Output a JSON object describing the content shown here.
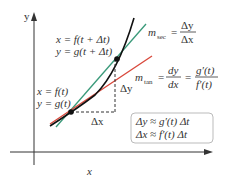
{
  "axes": {
    "x_label": "x",
    "y_label": "y"
  },
  "labels": {
    "point2_line1": "x = f(t + Δt)",
    "point2_line2": "y = g(t + Δt)",
    "point1_line1": "x = f(t)",
    "point1_line2": "y = g(t)",
    "m_sec": "m",
    "m_sec_sub": "sec",
    "m_sec_num": "Δy",
    "m_sec_den": "Δx",
    "m_tan": "m",
    "m_tan_sub": "tan",
    "m_tan_num1": "dy",
    "m_tan_den1": "dx",
    "m_tan_num2": "g′(t)",
    "m_tan_den2": "f′(t)",
    "delta_x": "Δx",
    "delta_y": "Δy",
    "approx_line1": "Δy ≈ g′(t) Δt",
    "approx_line2": "Δx ≈ f′(t) Δt",
    "equals": "="
  },
  "colors": {
    "curve": "#111111",
    "secant": "#3a9a7a",
    "tangent": "#d9483b",
    "axis": "#333333",
    "box_border": "#bbbbbb"
  }
}
